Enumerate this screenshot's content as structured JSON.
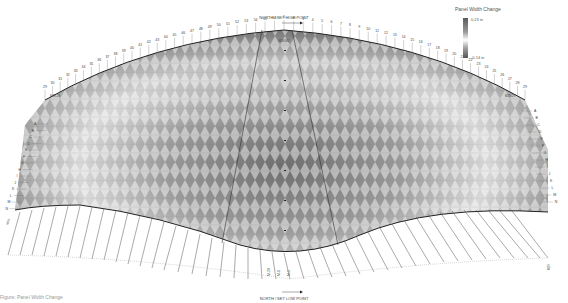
{
  "diagram": {
    "title_top": "NORTH / SET HIGH POINT",
    "title_bottom": "NORTH / SET LOW POINT",
    "top_column_labels_left": [
      "29",
      "30",
      "31",
      "32",
      "33",
      "34",
      "35",
      "36",
      "37",
      "38",
      "39",
      "40",
      "41",
      "42",
      "43",
      "44",
      "45",
      "46",
      "47",
      "48",
      "49",
      "50",
      "51",
      "52",
      "53",
      "54",
      "55",
      "56"
    ],
    "top_column_labels_right": [
      "1",
      "2",
      "3",
      "4",
      "5",
      "6",
      "7",
      "8",
      "9",
      "10",
      "11",
      "12",
      "13",
      "14",
      "15",
      "16",
      "17",
      "18",
      "19",
      "20",
      "21",
      "22",
      "23",
      "24",
      "25",
      "26",
      "27",
      "28",
      "29"
    ],
    "left_row_labels": [
      "A",
      "B",
      "C",
      "D",
      "E",
      "F",
      "G",
      "H",
      "I",
      "J",
      "K",
      "L",
      "M",
      "N"
    ],
    "right_row_labels": [
      "A",
      "B",
      "C",
      "D",
      "E",
      "F",
      "G",
      "H",
      "I",
      "J",
      "K",
      "L",
      "M",
      "N"
    ],
    "bottom_markers": [
      "M-29",
      "M-1",
      "M-2"
    ],
    "corner_labels": {
      "top_left": "M29-29",
      "top_right": "M29-29",
      "bottom_left": "M29",
      "bottom_right": "M29",
      "top_center": "M56-M1"
    },
    "caption": "Figure: Panel Width Change"
  },
  "legend": {
    "title": "Panel Width Change",
    "max_label": "0.23 in",
    "min_label": "-0.14 in",
    "colors": {
      "high": "#5a5a5a",
      "mid": "#ffffff",
      "low": "#555555"
    }
  }
}
